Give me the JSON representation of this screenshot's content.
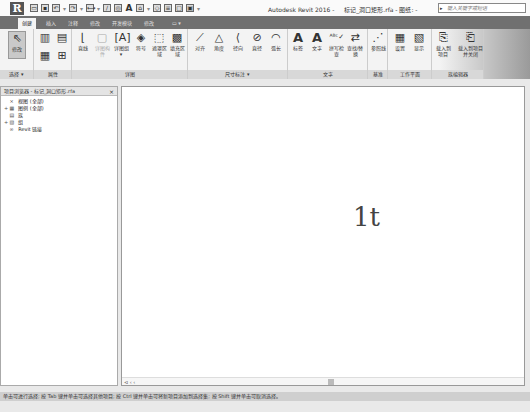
{
  "titlebar": {
    "app_button": "R",
    "app_name": "Autodesk Revit 2016 -",
    "document": "标记_洞口矩形.rfa - 图纸: -",
    "search_placeholder": "键入关键字或短语",
    "search_arrow": "▸"
  },
  "quick_access": [
    "open",
    "save",
    "undo",
    "redo",
    "measure",
    "aligned-dimension",
    "text",
    "3d-view",
    "section",
    "thin-lines",
    "close-windows",
    "switch-windows"
  ],
  "tabs": [
    {
      "label": "创建",
      "active": true
    },
    {
      "label": "插入",
      "active": false
    },
    {
      "label": "注释",
      "active": false
    },
    {
      "label": "修改",
      "active": false
    },
    {
      "label": "开发模块",
      "active": false
    },
    {
      "label": "修改",
      "active": false
    },
    {
      "label": "▭ ▾",
      "active": false
    }
  ],
  "ribbon": {
    "panels": [
      {
        "label": "选择 ▾",
        "buttons": [
          {
            "label": "修改",
            "icon": "arrow-cursor-icon"
          }
        ]
      },
      {
        "label": "属性",
        "buttons": [
          {
            "label": "",
            "icon": "family-types-icon"
          },
          {
            "label": "",
            "icon": "properties-icon"
          }
        ]
      },
      {
        "label": "详图",
        "buttons": [
          {
            "label": "直线",
            "icon": "line-icon"
          },
          {
            "label": "详图构件",
            "icon": "detail-component-icon"
          },
          {
            "label": "详图组 ▾",
            "icon": "detail-group-icon"
          },
          {
            "label": "符号",
            "icon": "symbol-icon"
          },
          {
            "label": "遮罩区域",
            "icon": "masking-region-icon"
          },
          {
            "label": "填充区域",
            "icon": "filled-region-icon"
          }
        ]
      },
      {
        "label": "尺寸标注 ▾",
        "buttons": [
          {
            "label": "对齐",
            "icon": "aligned-dim-icon"
          },
          {
            "label": "角度",
            "icon": "angular-dim-icon"
          },
          {
            "label": "径向",
            "icon": "radial-dim-icon"
          },
          {
            "label": "直径",
            "icon": "diameter-dim-icon"
          },
          {
            "label": "弧长",
            "icon": "arc-length-icon"
          }
        ]
      },
      {
        "label": "文字",
        "buttons": [
          {
            "label": "标签",
            "icon": "label-icon"
          },
          {
            "label": "文字",
            "icon": "text-icon"
          },
          {
            "label": "拼写检查",
            "icon": "spell-check-icon"
          },
          {
            "label": "查找/替换",
            "icon": "find-replace-icon"
          }
        ]
      },
      {
        "label": "基准",
        "buttons": [
          {
            "label": "参照线",
            "icon": "reference-line-icon"
          }
        ]
      },
      {
        "label": "工作平面",
        "buttons": [
          {
            "label": "设置",
            "icon": "set-workplane-icon"
          },
          {
            "label": "显示",
            "icon": "show-workplane-icon"
          }
        ]
      },
      {
        "label": "族编辑器",
        "buttons": [
          {
            "label": "载入到项目",
            "icon": "load-into-project-icon"
          },
          {
            "label": "载入到项目并关闭",
            "icon": "load-close-icon"
          }
        ]
      }
    ]
  },
  "project_browser": {
    "title": "项目浏览器 - 标记_洞口矩形.rfa",
    "close": "×",
    "nodes": [
      {
        "expander": "",
        "icon": "⨯",
        "label": "视图 (全部)"
      },
      {
        "expander": "+",
        "icon": "▦",
        "label": "图例 (全部)"
      },
      {
        "expander": "",
        "icon": "▤",
        "label": "族"
      },
      {
        "expander": "+",
        "icon": "▧",
        "label": "组"
      },
      {
        "expander": "",
        "icon": "∞",
        "label": "Revit 链接"
      }
    ]
  },
  "canvas": {
    "text": "1t",
    "scroll_controls": "⊲ ‹ ‹"
  },
  "status_bar": {
    "text": "单击可进行选择; 按 Tab 键并单击可选择其他项目; 按 Ctrl 键并单击可将新项目添加到选择集; 按 Shift 键并单击可取消选择。"
  }
}
